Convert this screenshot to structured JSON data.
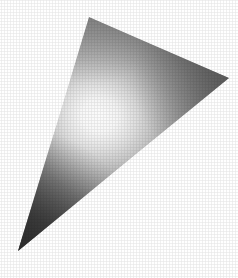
{
  "image": {
    "title": "Shaded Triangle Render",
    "kind": "gouraud-shaded-polygon",
    "width": 238,
    "height": 278,
    "background_color": "#ffffff"
  },
  "shape": {
    "name": "triangle",
    "vertex_count": 3,
    "vertices": [
      {
        "label": "apex-top",
        "x": 89,
        "y": 17
      },
      {
        "label": "right",
        "x": 229,
        "y": 78
      },
      {
        "label": "bottom-left",
        "x": 18,
        "y": 251
      }
    ],
    "points_attr": "89,17 229,78 18,251",
    "outline": "none"
  },
  "shading": {
    "model": "radial-specular-highlight",
    "highlight": {
      "center_x": 100,
      "center_y": 115,
      "radius_x": 130,
      "radius_y": 120,
      "peak_color": "#fdfdfd"
    },
    "stops": [
      {
        "offset": "0%",
        "color": "#fdfdfd"
      },
      {
        "offset": "14%",
        "color": "#f8f8f8"
      },
      {
        "offset": "28%",
        "color": "#e2e2e2"
      },
      {
        "offset": "42%",
        "color": "#c6c6c6"
      },
      {
        "offset": "56%",
        "color": "#a8a8a8"
      },
      {
        "offset": "70%",
        "color": "#8c8c8c"
      },
      {
        "offset": "84%",
        "color": "#6e6e6e"
      },
      {
        "offset": "100%",
        "color": "#4a4a4a"
      }
    ],
    "directional_overlay": {
      "model": "linear-gradient",
      "from_x": 200,
      "from_y": 40,
      "to_x": 24,
      "to_y": 246,
      "stops": [
        {
          "offset": "0%",
          "color": "#5a5a5a",
          "opacity": 0.62
        },
        {
          "offset": "22%",
          "color": "#8a8a8a",
          "opacity": 0.3
        },
        {
          "offset": "44%",
          "color": "#cfcfcf",
          "opacity": 0.05
        },
        {
          "offset": "58%",
          "color": "#ffffff",
          "opacity": 0.0
        },
        {
          "offset": "74%",
          "color": "#7a7a7a",
          "opacity": 0.3
        },
        {
          "offset": "100%",
          "color": "#2e2e2e",
          "opacity": 0.72
        }
      ]
    },
    "corner_shadows": [
      {
        "label": "bottom-left-dark",
        "center_x": 20,
        "center_y": 248,
        "radius": 120,
        "color": "#2b2b2b",
        "opacity": 0.78
      },
      {
        "label": "right-vertex-mid",
        "center_x": 229,
        "center_y": 78,
        "radius": 96,
        "color": "#5e5e5e",
        "opacity": 0.55
      },
      {
        "label": "apex-mid",
        "center_x": 92,
        "center_y": 20,
        "radius": 66,
        "color": "#8e8e8e",
        "opacity": 0.42
      }
    ],
    "sample_tones": [
      {
        "label": "highlight-core",
        "x": 100,
        "y": 115,
        "color": "#fdfdfd"
      },
      {
        "label": "upper-left-edge",
        "x": 70,
        "y": 60,
        "color": "#999999"
      },
      {
        "label": "upper-right-band",
        "x": 170,
        "y": 70,
        "color": "#888888"
      },
      {
        "label": "right-vertex",
        "x": 215,
        "y": 76,
        "color": "#6a6a6a"
      },
      {
        "label": "lower-left-dark",
        "x": 55,
        "y": 200,
        "color": "#3d3d3d"
      },
      {
        "label": "bottom-tip",
        "x": 28,
        "y": 240,
        "color": "#3a3a3a"
      },
      {
        "label": "lower-right-edge",
        "x": 130,
        "y": 150,
        "color": "#efefef"
      }
    ],
    "texture": {
      "type": "halftone-dither",
      "cell_px": 2,
      "opacity": 0.1
    }
  }
}
